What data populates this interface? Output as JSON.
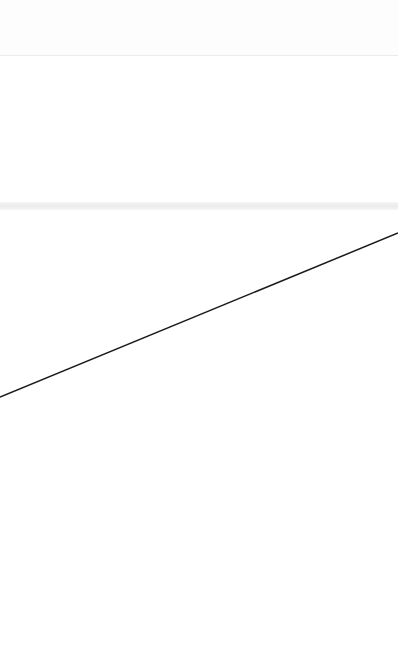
{
  "canvas": {
    "width": 398,
    "height": 665,
    "background": "#ffffff"
  },
  "regions": {
    "top_divider": {
      "y": 55,
      "color": "#ececec"
    },
    "band": {
      "y": 202,
      "height": 8,
      "color": "#ebebeb"
    }
  },
  "line": {
    "x1": 0,
    "y1": 397,
    "x2": 398,
    "y2": 233,
    "color": "#1a1a1a",
    "width": 1.5
  }
}
